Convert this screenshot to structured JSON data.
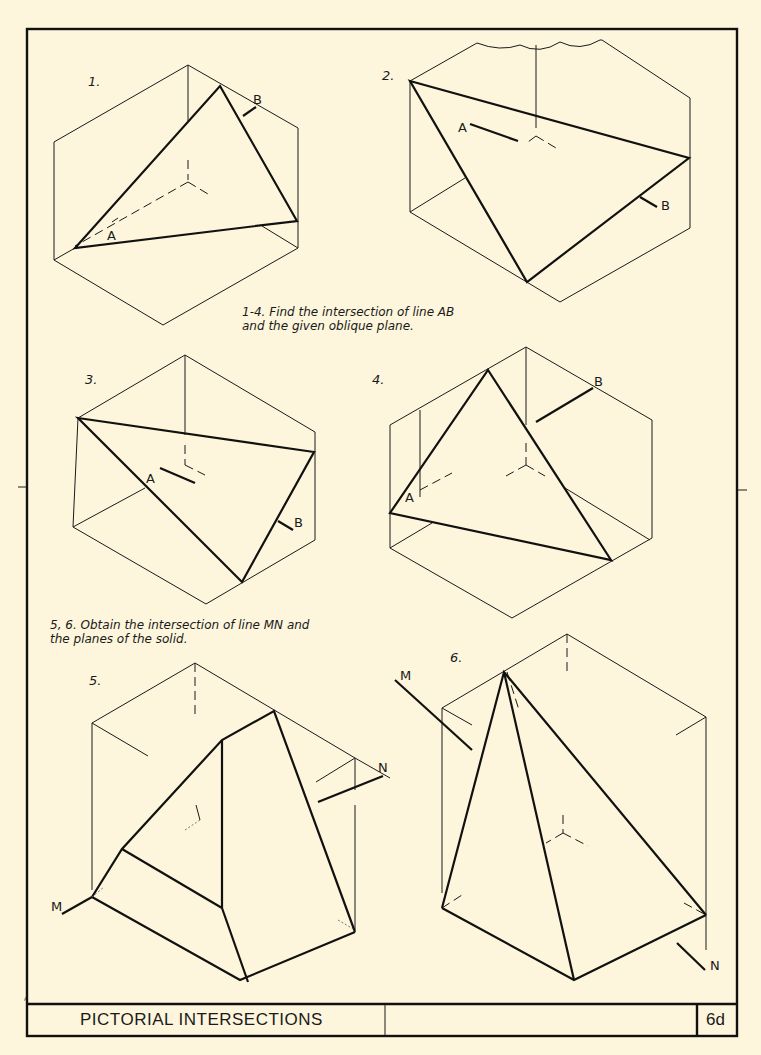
{
  "sheet": {
    "title": "PICTORIAL INTERSECTIONS",
    "sheet_number": "6d",
    "corner_mark": "A"
  },
  "instructions": {
    "problems_1_4": {
      "line1": "1-4. Find the intersection of line AB",
      "line2": "and the given oblique plane."
    },
    "problems_5_6": {
      "line1": "5, 6. Obtain the intersection of line MN and",
      "line2": "the planes of the solid."
    }
  },
  "problems": [
    {
      "number": "1.",
      "labels": [
        "A",
        "B"
      ]
    },
    {
      "number": "2.",
      "labels": [
        "A",
        "B"
      ]
    },
    {
      "number": "3.",
      "labels": [
        "A",
        "B"
      ]
    },
    {
      "number": "4.",
      "labels": [
        "A",
        "B"
      ]
    },
    {
      "number": "5.",
      "labels": [
        "M",
        "N"
      ]
    },
    {
      "number": "6.",
      "labels": [
        "M",
        "N"
      ]
    }
  ],
  "colors": {
    "paper": "#fdf6dc",
    "ink": "#1a1a1a"
  }
}
